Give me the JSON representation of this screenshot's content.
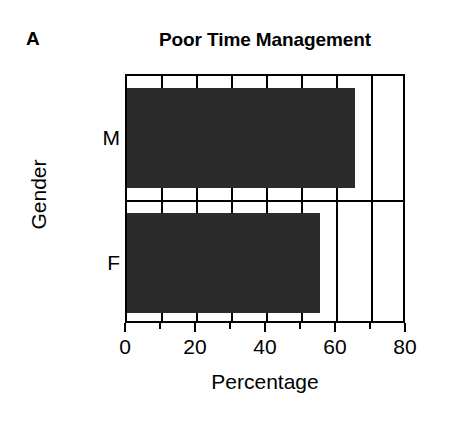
{
  "figure": {
    "panel_label": "A",
    "title": "Poor Time Management",
    "background_color": "#ffffff",
    "foreground_color": "#000000"
  },
  "axes": {
    "x_title": "Percentage",
    "y_title": "Gender"
  },
  "chart_data": {
    "type": "bar",
    "orientation": "horizontal",
    "title": "Poor Time Management",
    "xlabel": "Percentage",
    "ylabel": "Gender",
    "categories": [
      "M",
      "F"
    ],
    "values": [
      65,
      55
    ],
    "bar_color": "#2b2b2b",
    "xlim": [
      0,
      80
    ],
    "ylim": [
      0,
      2
    ],
    "x_major_ticks": [
      0,
      20,
      40,
      60,
      80
    ],
    "x_minor_ticks": [
      10,
      30,
      50,
      70
    ],
    "x_tick_labels": [
      "0",
      "20",
      "40",
      "60",
      "80"
    ],
    "grid": "vertical gridlines at every 10 units",
    "legend": "none",
    "annotations": [
      "A"
    ],
    "series": [
      {
        "name": "Poor Time Management",
        "categories": [
          "M",
          "F"
        ],
        "values": [
          65,
          55
        ]
      }
    ],
    "points": [
      {
        "category": "M",
        "value": 65,
        "unit": "%"
      },
      {
        "category": "F",
        "value": 55,
        "unit": "%"
      }
    ]
  }
}
